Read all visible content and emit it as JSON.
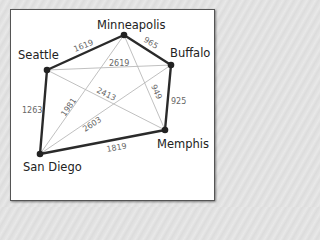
{
  "diagram": {
    "type": "weighted-graph",
    "nodes": [
      {
        "id": "minneapolis",
        "label": "Minneapolis"
      },
      {
        "id": "buffalo",
        "label": "Buffalo"
      },
      {
        "id": "seattle",
        "label": "Seattle"
      },
      {
        "id": "memphis",
        "label": "Memphis"
      },
      {
        "id": "san_diego",
        "label": "San Diego"
      }
    ],
    "edges": [
      {
        "from": "seattle",
        "to": "minneapolis",
        "weight": "1619",
        "highlighted": true
      },
      {
        "from": "minneapolis",
        "to": "buffalo",
        "weight": "965",
        "highlighted": true
      },
      {
        "from": "buffalo",
        "to": "memphis",
        "weight": "925",
        "highlighted": true
      },
      {
        "from": "memphis",
        "to": "san_diego",
        "weight": "1819",
        "highlighted": true
      },
      {
        "from": "san_diego",
        "to": "seattle",
        "weight": "1263",
        "highlighted": true
      },
      {
        "from": "seattle",
        "to": "buffalo",
        "weight": "2619",
        "highlighted": false
      },
      {
        "from": "seattle",
        "to": "memphis",
        "weight": "2413",
        "highlighted": false
      },
      {
        "from": "minneapolis",
        "to": "san_diego",
        "weight": "1981",
        "highlighted": false
      },
      {
        "from": "minneapolis",
        "to": "memphis",
        "weight": "949",
        "highlighted": false
      },
      {
        "from": "buffalo",
        "to": "san_diego",
        "weight": "2603",
        "highlighted": false
      }
    ]
  },
  "colors": {
    "highlight_edge": "#2a2a2a",
    "other_edge": "#b9b9b9",
    "weight_text": "#666666",
    "city_text": "#222222"
  }
}
